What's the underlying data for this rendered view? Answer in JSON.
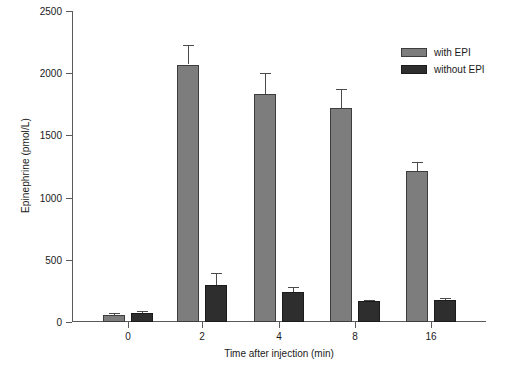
{
  "chart_data": {
    "type": "bar",
    "title": "",
    "xlabel": "Time after injection (min)",
    "ylabel": "Epinephrine (pmol/L)",
    "categories": [
      "0",
      "2",
      "4",
      "8",
      "16"
    ],
    "ylim": [
      0,
      2500
    ],
    "yticks": [
      0,
      500,
      1000,
      1500,
      2000,
      2500
    ],
    "ytick_labels": [
      "0",
      "500",
      "1000",
      "1500",
      "2000",
      "2500"
    ],
    "grid": false,
    "legend_position": "upper right",
    "series": [
      {
        "name": "with EPI",
        "color": "#7d7d7d",
        "values": [
          60,
          2070,
          1835,
          1720,
          1210
        ],
        "errors": [
          15,
          155,
          170,
          150,
          75
        ]
      },
      {
        "name": "without EPI",
        "color": "#2e2e2e",
        "values": [
          70,
          295,
          240,
          170,
          180
        ],
        "errors": [
          15,
          100,
          45,
          10,
          10
        ]
      }
    ]
  },
  "axes": {
    "y_title": "Epinephrine (pmol/L)",
    "x_title": "Time after injection (min)"
  },
  "legend": {
    "items": [
      {
        "label": "with EPI"
      },
      {
        "label": "without EPI"
      }
    ]
  }
}
